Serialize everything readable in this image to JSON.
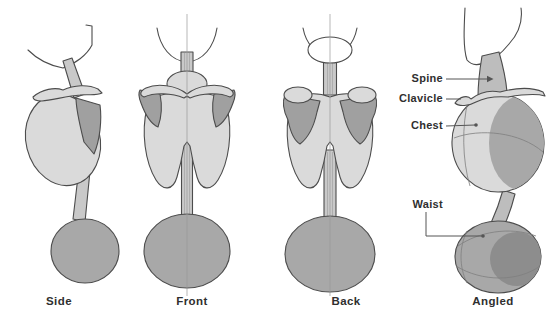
{
  "diagram": {
    "title_hidden": "",
    "views": [
      {
        "id": "side",
        "label": "Side"
      },
      {
        "id": "front",
        "label": "Front"
      },
      {
        "id": "back",
        "label": "Back"
      },
      {
        "id": "angled",
        "label": "Angled"
      }
    ],
    "annotations": [
      {
        "id": "spine",
        "label": "Spine"
      },
      {
        "id": "clavicle",
        "label": "Clavicle"
      },
      {
        "id": "chest",
        "label": "Chest"
      },
      {
        "id": "waist",
        "label": "Waist"
      }
    ],
    "colors": {
      "background": "#ffffff",
      "outline": "#4c4c4c",
      "fill_light": "#dadada",
      "fill_bar": "#c9c9c9",
      "fill_bar2": "#bdbdbd",
      "fill_mid": "#a8a8a8",
      "fill_shade": "#a0a0a0",
      "fill_dark": "#8d8d8d",
      "seam": "#7f7f7f",
      "centerline": "#999999",
      "leader": "#555555",
      "text": "#2f2f2f"
    }
  }
}
